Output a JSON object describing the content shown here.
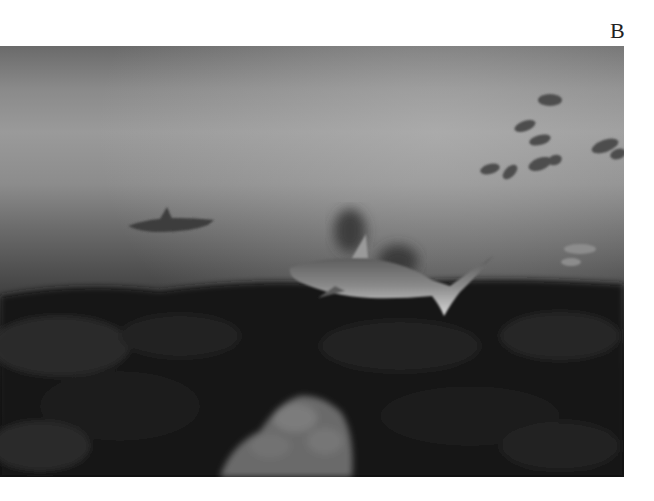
{
  "figure": {
    "panel_label": "B",
    "photo": {
      "description": "Underwater photograph of reef sharks swimming over a dark coral reef with a school of fish in the hazy water above",
      "subjects": [
        "large shark in foreground",
        "distant shark at left",
        "school of fish at upper right",
        "coral reef"
      ],
      "tone": "grayscale"
    }
  }
}
